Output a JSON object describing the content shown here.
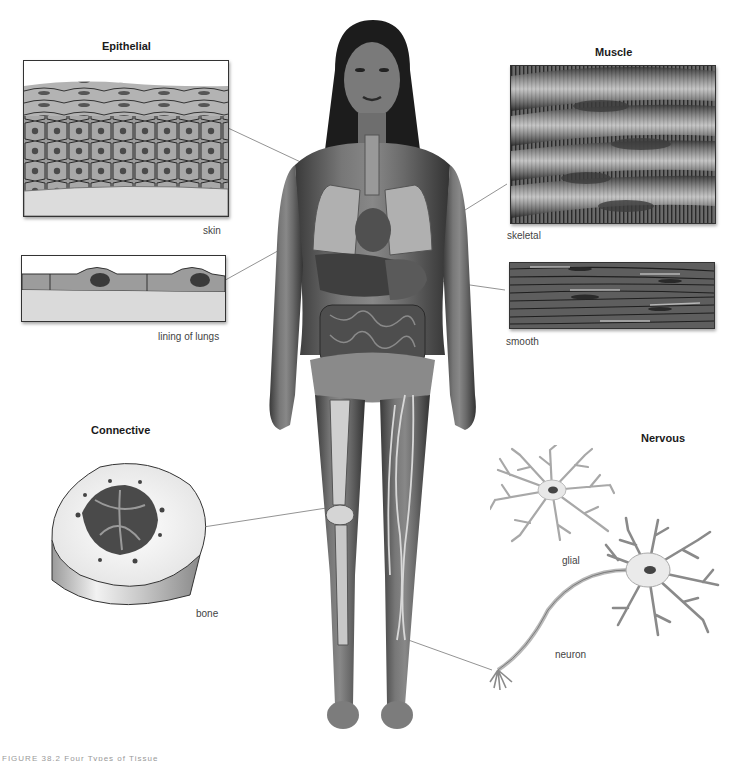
{
  "figure": {
    "caption_partial": "FIGURE 38.2   Four Types of Tissue"
  },
  "groups": {
    "epithelial": {
      "title": "Epithelial",
      "panels": [
        {
          "label": "skin"
        },
        {
          "label": "lining of lungs"
        }
      ]
    },
    "muscle": {
      "title": "Muscle",
      "panels": [
        {
          "label": "skeletal"
        },
        {
          "label": "smooth"
        }
      ]
    },
    "connective": {
      "title": "Connective",
      "panels": [
        {
          "label": "bone"
        }
      ]
    },
    "nervous": {
      "title": "Nervous",
      "panels": [
        {
          "label": "glial"
        },
        {
          "label": "neuron"
        }
      ]
    }
  },
  "colors": {
    "background": "#ffffff",
    "leader_line": "#666666",
    "tissue_gray": "#8a8a8a",
    "dark_gray": "#3a3a3a"
  }
}
